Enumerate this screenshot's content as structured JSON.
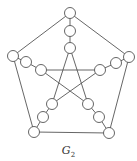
{
  "diagram": {
    "label": "G",
    "label_subscript": "2",
    "stroke_color": "#555555",
    "node_fill": "#ffffff",
    "node_radius": 5.5,
    "nodes": [
      {
        "id": "o_top",
        "x": 70,
        "y": 13
      },
      {
        "id": "s_top1",
        "x": 70,
        "y": 31
      },
      {
        "id": "i_top",
        "x": 70,
        "y": 48
      },
      {
        "id": "o_left",
        "x": 13,
        "y": 56
      },
      {
        "id": "s_left1",
        "x": 26,
        "y": 62
      },
      {
        "id": "i_left",
        "x": 41,
        "y": 70
      },
      {
        "id": "o_right",
        "x": 129,
        "y": 57
      },
      {
        "id": "s_right1",
        "x": 116,
        "y": 63
      },
      {
        "id": "i_right",
        "x": 100,
        "y": 70
      },
      {
        "id": "o_bl",
        "x": 34,
        "y": 132
      },
      {
        "id": "s_bl1",
        "x": 43,
        "y": 117
      },
      {
        "id": "i_bl",
        "x": 52,
        "y": 104
      },
      {
        "id": "o_br",
        "x": 109,
        "y": 133
      },
      {
        "id": "s_br1",
        "x": 99,
        "y": 117
      },
      {
        "id": "i_br",
        "x": 88,
        "y": 104
      }
    ],
    "edges": [
      [
        "o_top",
        "o_left"
      ],
      [
        "o_top",
        "o_right"
      ],
      [
        "o_left",
        "o_bl"
      ],
      [
        "o_right",
        "o_br"
      ],
      [
        "o_bl",
        "o_br"
      ],
      [
        "o_top",
        "s_top1"
      ],
      [
        "s_top1",
        "i_top"
      ],
      [
        "o_left",
        "s_left1"
      ],
      [
        "s_left1",
        "i_left"
      ],
      [
        "o_right",
        "s_right1"
      ],
      [
        "s_right1",
        "i_right"
      ],
      [
        "o_bl",
        "s_bl1"
      ],
      [
        "s_bl1",
        "i_bl"
      ],
      [
        "o_br",
        "s_br1"
      ],
      [
        "s_br1",
        "i_br"
      ],
      [
        "i_top",
        "i_bl"
      ],
      [
        "i_top",
        "i_br"
      ],
      [
        "i_left",
        "i_right"
      ],
      [
        "i_left",
        "i_br"
      ],
      [
        "i_right",
        "i_bl"
      ]
    ]
  }
}
